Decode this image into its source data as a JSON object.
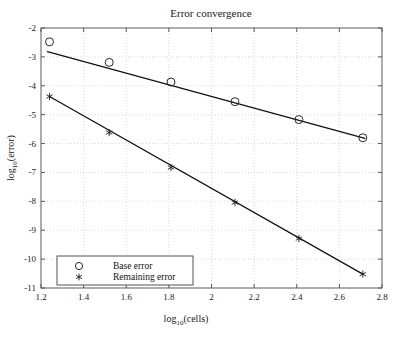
{
  "chart_data": {
    "type": "scatter",
    "title": "Error convergence",
    "xlabel": "log10(cells)",
    "ylabel": "log10(error)",
    "xlabel_base": "log",
    "xlabel_sub": "10",
    "xlabel_rest": "(cells)",
    "ylabel_base": "log",
    "ylabel_sub": "10",
    "ylabel_rest": "(error)",
    "xlim": [
      1.2,
      2.8
    ],
    "ylim": [
      -11,
      -2
    ],
    "xticks": [
      1.2,
      1.4,
      1.6,
      1.8,
      2.0,
      2.2,
      2.4,
      2.6,
      2.8
    ],
    "xticklabels": [
      "1.2",
      "1.4",
      "1.6",
      "1.8",
      "2",
      "2.2",
      "2.4",
      "2.6",
      "2.8"
    ],
    "yticks": [
      -11,
      -10,
      -9,
      -8,
      -7,
      -6,
      -5,
      -4,
      -3,
      -2
    ],
    "yticklabels": [
      "-11",
      "-10",
      "-9",
      "-8",
      "-7",
      "-6",
      "-5",
      "-4",
      "-3",
      "-2"
    ],
    "grid": true,
    "legend_position": "lower-left",
    "series": [
      {
        "name": "Base error",
        "marker": "circle",
        "x": [
          1.24,
          1.52,
          1.81,
          2.11,
          2.41,
          2.71
        ],
        "values": [
          -2.48,
          -3.19,
          -3.87,
          -4.55,
          -5.17,
          -5.8
        ],
        "fit_line": {
          "x": [
            1.23,
            2.72
          ],
          "y": [
            -2.82,
            -5.82
          ]
        }
      },
      {
        "name": "Remaining error",
        "marker": "asterisk",
        "x": [
          1.24,
          1.52,
          1.81,
          2.11,
          2.41,
          2.71
        ],
        "values": [
          -4.37,
          -5.62,
          -6.83,
          -8.04,
          -9.29,
          -10.52
        ],
        "fit_line": {
          "x": [
            1.24,
            2.71
          ],
          "y": [
            -4.37,
            -10.52
          ]
        }
      }
    ]
  },
  "legend": {
    "entries": [
      {
        "label": "Base error",
        "marker": "circle"
      },
      {
        "label": "Remaining error",
        "marker": "asterisk"
      }
    ]
  }
}
